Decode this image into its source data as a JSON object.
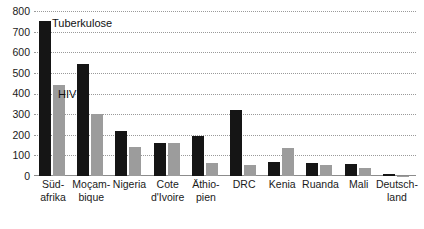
{
  "chart_data": {
    "type": "bar",
    "title": "",
    "xlabel": "",
    "ylabel": "",
    "ylim": [
      0,
      800
    ],
    "ytick_step": 100,
    "yticks": [
      0,
      100,
      200,
      300,
      400,
      500,
      600,
      700,
      800
    ],
    "ytick_labels": [
      "0",
      "100",
      "200",
      "300",
      "400",
      "500",
      "600",
      "700",
      "800"
    ],
    "grid": true,
    "legend_position": "inline-annotation",
    "categories": [
      "Süd-\nafrika",
      "Moçam-\nbique",
      "Nigeria",
      "Cote\nd'Ivoire",
      "Äthio-\npien",
      "DRC",
      "Kenia",
      "Ruanda",
      "Mali",
      "Deutsch-\nland"
    ],
    "series": [
      {
        "name": "Tuberkulose",
        "color": "#151515",
        "values": [
          750,
          545,
          220,
          160,
          193,
          320,
          70,
          65,
          60,
          8
        ]
      },
      {
        "name": "HIV",
        "color": "#9c9c9c",
        "values": [
          440,
          300,
          140,
          160,
          65,
          55,
          135,
          55,
          38,
          2
        ]
      }
    ],
    "annotations": [
      {
        "text": "Tuberkulose",
        "series": "Tuberkulose"
      },
      {
        "text": "HIV",
        "series": "HIV"
      }
    ]
  }
}
